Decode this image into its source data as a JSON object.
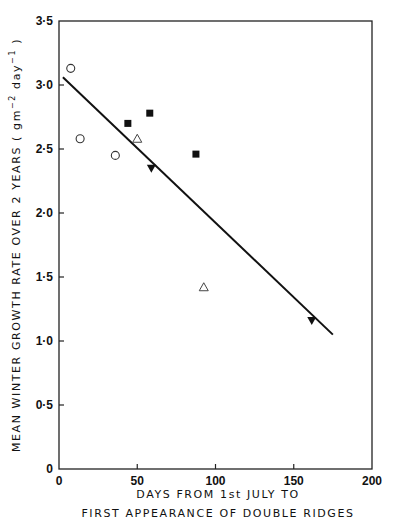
{
  "chart_data": {
    "type": "scatter",
    "title": "",
    "xlabel": "DAYS FROM 1st JULY TO FIRST APPEARANCE OF DOUBLE RIDGES",
    "xlabel_lines": [
      "DAYS FROM 1st JULY  TO",
      "FIRST  APPEARANCE  OF  DOUBLE  RIDGES"
    ],
    "ylabel": "MEAN WINTER GROWTH RATE OVER 2 YEARS (gm⁻² day⁻¹)",
    "ylabel_main": "MEAN  WINTER  GROWTH  RATE  OVER  2  YEARS  ( gm",
    "ylabel_sup1": "−2",
    "ylabel_mid": " day",
    "ylabel_sup2": "−1",
    "ylabel_end": " )",
    "xlim": [
      0,
      200
    ],
    "ylim": [
      0,
      3.5
    ],
    "x_ticks": [
      0,
      50,
      100,
      150,
      200
    ],
    "x_tick_labels": [
      "0",
      "50",
      "100",
      "150",
      "200"
    ],
    "y_ticks": [
      0,
      0.5,
      1.0,
      1.5,
      2.0,
      2.5,
      3.0,
      3.5
    ],
    "y_tick_labels": [
      "0",
      "0·5",
      "1·0",
      "1·5",
      "2·0",
      "2·5",
      "3·0",
      "3·5"
    ],
    "grid": false,
    "legend": null,
    "series": [
      {
        "name": "open circles",
        "marker": "circle-open",
        "x": [
          7.5,
          13.5,
          36
        ],
        "y": [
          3.13,
          2.58,
          2.45
        ]
      },
      {
        "name": "filled squares",
        "marker": "square-filled",
        "x": [
          44,
          58,
          87.5
        ],
        "y": [
          2.7,
          2.78,
          2.46
        ]
      },
      {
        "name": "open triangles",
        "marker": "triangle-up-open",
        "x": [
          50,
          92.5
        ],
        "y": [
          2.58,
          1.42
        ]
      },
      {
        "name": "filled inverted triangles",
        "marker": "triangle-down-filled",
        "x": [
          59,
          161.5
        ],
        "y": [
          2.35,
          1.16
        ]
      }
    ],
    "fit_line": {
      "name": "regression line",
      "x": [
        2.5,
        175
      ],
      "y": [
        3.06,
        1.05
      ]
    }
  }
}
